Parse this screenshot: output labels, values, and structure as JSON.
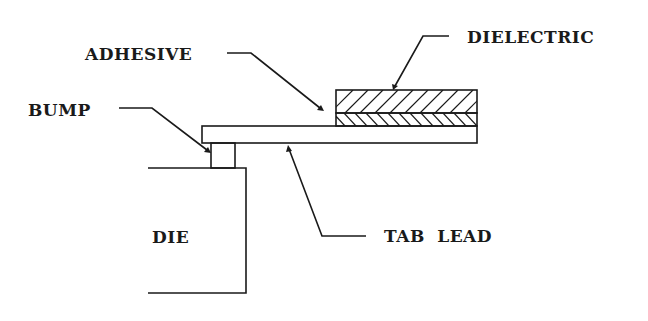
{
  "diagram": {
    "labels": {
      "dielectric": "DIELECTRIC",
      "adhesive": "ADHESIVE",
      "bump": "BUMP",
      "die": "DIE",
      "tab_lead": "TAB LEAD"
    },
    "components": [
      {
        "name": "dielectric",
        "fill": "diagonal hatch (/)"
      },
      {
        "name": "adhesive",
        "fill": "diagonal hatch (\\)"
      },
      {
        "name": "tab_lead",
        "fill": "none"
      },
      {
        "name": "bump",
        "fill": "none"
      },
      {
        "name": "die",
        "fill": "none"
      }
    ],
    "colors": {
      "line": "#1a1a1a",
      "background": "#ffffff"
    }
  }
}
